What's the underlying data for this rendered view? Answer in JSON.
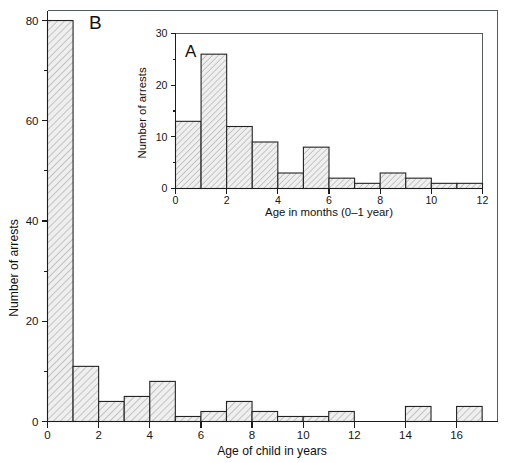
{
  "figure": {
    "background_color": "#ffffff",
    "line_color": "#1c1c1c",
    "bar_fill_color": "#ececec",
    "bar_hatch_color": "#9a9a9a",
    "frame_color": "#555a5e"
  },
  "chart_data": [
    {
      "id": "panel-b",
      "type": "bar",
      "panel_label": "B",
      "title": "",
      "xlabel": "Age of child in years",
      "ylabel": "Number of arrests",
      "xlim": [
        0,
        17.6
      ],
      "ylim": [
        0,
        82
      ],
      "grid": false,
      "legend": "none",
      "xticks": [
        0,
        2,
        4,
        6,
        8,
        10,
        12,
        14,
        16
      ],
      "xticklabels": [
        "0",
        "2",
        "4",
        "6",
        "8",
        "10",
        "12",
        "14",
        "16"
      ],
      "yticks": [
        0,
        20,
        40,
        60,
        80
      ],
      "yticklabels": [
        "0",
        "20",
        "40",
        "60",
        "80"
      ],
      "yticks_minor": [
        10,
        30,
        50,
        70
      ],
      "bin_edges": [
        0,
        1,
        2,
        3,
        4,
        5,
        6,
        7,
        8,
        9,
        10,
        11,
        12,
        13,
        14,
        15,
        16,
        17
      ],
      "categories": [
        "0-1",
        "1-2",
        "2-3",
        "3-4",
        "4-5",
        "5-6",
        "6-7",
        "7-8",
        "8-9",
        "9-10",
        "10-11",
        "11-12",
        "12-13",
        "13-14",
        "14-15",
        "15-16",
        "16-17"
      ],
      "values": [
        80,
        11,
        4,
        5,
        8,
        1,
        2,
        4,
        2,
        1,
        1,
        2,
        0,
        0,
        3,
        0,
        3
      ]
    },
    {
      "id": "panel-a",
      "type": "bar",
      "panel_label": "A",
      "title": "",
      "xlabel": "Age in months (0–1 year)",
      "ylabel": "Number of arrests",
      "xlim": [
        0,
        12
      ],
      "ylim": [
        0,
        30
      ],
      "grid": false,
      "legend": "none",
      "xticks": [
        0,
        2,
        4,
        6,
        8,
        10,
        12
      ],
      "xticklabels": [
        "0",
        "2",
        "4",
        "6",
        "8",
        "10",
        "12"
      ],
      "yticks": [
        0,
        10,
        20,
        30
      ],
      "yticklabels": [
        "0",
        "10",
        "20",
        "30"
      ],
      "yticks_minor": [
        5,
        15,
        25
      ],
      "bin_edges": [
        0,
        1,
        2,
        3,
        4,
        5,
        6,
        7,
        8,
        9,
        10,
        11,
        12
      ],
      "categories": [
        "0-1",
        "1-2",
        "2-3",
        "3-4",
        "4-5",
        "5-6",
        "6-7",
        "7-8",
        "8-9",
        "9-10",
        "10-11",
        "11-12"
      ],
      "values": [
        13,
        26,
        12,
        9,
        3,
        8,
        2,
        1,
        3,
        2,
        1,
        1
      ]
    }
  ]
}
